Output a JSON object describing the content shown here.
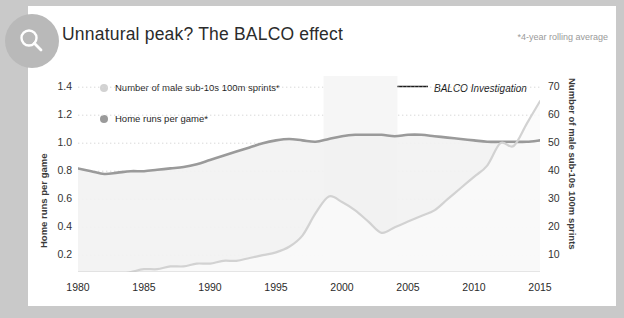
{
  "card": {
    "title": "Unnatural peak? The BALCO effect",
    "footnote": "*4-year rolling average",
    "search_icon": "search-icon"
  },
  "annotation": {
    "text": "BALCO Investigation",
    "arrow": "←"
  },
  "colors": {
    "home_runs": "#9a9a9a",
    "sprints": "#d2d2d2",
    "card_background": "#ffffff",
    "page_background": "#c9c9c9",
    "badge": "#b9b9b9",
    "gridline": "#d8d8d8",
    "text": "#2b2b2b"
  },
  "chart_data": {
    "type": "line",
    "title": "Unnatural peak? The BALCO effect",
    "xlabel": "",
    "ylabel": "Home runs per game",
    "ylabel_right": "Number of male sub-10s 100m sprints",
    "xlim": [
      1980,
      2015
    ],
    "ylim": [
      0.08,
      1.48
    ],
    "ylim_right": [
      4,
      74
    ],
    "yticks": [
      0.2,
      0.4,
      0.6,
      0.8,
      1.0,
      1.2,
      1.4
    ],
    "yticks_right": [
      10,
      20,
      30,
      40,
      50,
      60,
      70
    ],
    "xticks": [
      1980,
      1985,
      1990,
      1995,
      2000,
      2005,
      2010,
      2015
    ],
    "xtick_labels": [
      "1980",
      "1985",
      "1990",
      "1995",
      "2000",
      "2005",
      "2010",
      "2015"
    ],
    "ytick_labels": [
      "0.2",
      "0.4",
      "0.6",
      "0.8",
      "1.0",
      "1.2",
      "1.4"
    ],
    "ytick_labels_right": [
      "10",
      "20",
      "30",
      "40",
      "50",
      "60",
      "70"
    ],
    "grid": true,
    "legend_position": "top-left",
    "x": [
      1980,
      1981,
      1982,
      1983,
      1984,
      1985,
      1986,
      1987,
      1988,
      1989,
      1990,
      1991,
      1992,
      1993,
      1994,
      1995,
      1996,
      1997,
      1998,
      1999,
      2000,
      2001,
      2002,
      2003,
      2004,
      2005,
      2006,
      2007,
      2008,
      2009,
      2010,
      2011,
      2012,
      2013,
      2014,
      2015
    ],
    "series": [
      {
        "name": "Home runs per game*",
        "axis": "left",
        "color": "#9a9a9a",
        "values": [
          0.82,
          0.8,
          0.78,
          0.79,
          0.8,
          0.8,
          0.81,
          0.82,
          0.83,
          0.85,
          0.88,
          0.91,
          0.94,
          0.97,
          1.0,
          1.02,
          1.03,
          1.02,
          1.01,
          1.03,
          1.05,
          1.06,
          1.06,
          1.06,
          1.05,
          1.06,
          1.06,
          1.05,
          1.04,
          1.03,
          1.02,
          1.01,
          1.01,
          1.01,
          1.01,
          1.02
        ]
      },
      {
        "name": "Number of male sub-10s 100m sprints*",
        "axis": "right",
        "color": "#d2d2d2",
        "values": [
          2,
          2,
          3,
          3,
          4,
          5,
          5,
          6,
          6,
          7,
          7,
          8,
          8,
          9,
          10,
          11,
          13,
          17,
          25,
          31,
          29,
          26,
          22,
          18,
          20,
          22,
          24,
          26,
          30,
          34,
          38,
          42,
          50,
          49,
          57,
          65
        ]
      }
    ]
  }
}
